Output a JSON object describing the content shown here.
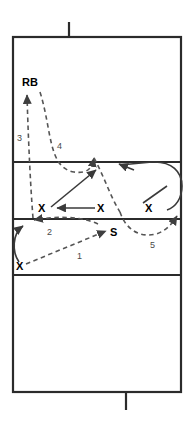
{
  "diagram": {
    "type": "football-play-diagram",
    "colors": {
      "field_line": "#2b2b2b",
      "solid_route": "#3a3a3a",
      "dashed_route": "#555555",
      "label": "#000000",
      "number": "#4a4a4a",
      "background": "#ffffff"
    },
    "field": {
      "outline": {
        "x": 13,
        "y": 37,
        "width": 168,
        "height": 355
      },
      "horizontal_lines_y": [
        162,
        219,
        275
      ],
      "ticks": [
        {
          "name": "top-hash-tick",
          "x": 69,
          "y1": 22,
          "y2": 37
        },
        {
          "name": "bottom-hash-tick",
          "x": 126,
          "y1": 392,
          "y2": 410
        }
      ]
    },
    "players": [
      {
        "id": "rb",
        "label": "RB",
        "x": 28,
        "y": 82,
        "kind": "text-label"
      },
      {
        "id": "x-left",
        "label": "X",
        "x": 42,
        "y": 211,
        "kind": "x-marker"
      },
      {
        "id": "x-mid",
        "label": "X",
        "x": 101,
        "y": 211,
        "kind": "x-marker"
      },
      {
        "id": "x-right",
        "label": "X",
        "x": 149,
        "y": 211,
        "kind": "x-marker"
      },
      {
        "id": "x-bottom-left",
        "label": "X",
        "x": 20,
        "y": 268,
        "kind": "x-marker"
      },
      {
        "id": "s-safety",
        "label": "S",
        "x": 114,
        "y": 234,
        "kind": "text-label"
      }
    ],
    "route_numbers": [
      {
        "id": "route-1",
        "label": "1",
        "x": 80,
        "y": 257
      },
      {
        "id": "route-2",
        "label": "2",
        "x": 49,
        "y": 232
      },
      {
        "id": "route-3",
        "label": "3",
        "x": 19,
        "y": 138
      },
      {
        "id": "route-4",
        "label": "4",
        "x": 59,
        "y": 146
      },
      {
        "id": "route-5",
        "label": "5",
        "x": 152,
        "y": 245
      }
    ],
    "routes": [
      {
        "id": "route-1-path",
        "style": "dashed",
        "desc": "from bottom-left X up-right to S"
      },
      {
        "id": "route-2-path",
        "style": "dashed",
        "desc": "from S back left to near left hash"
      },
      {
        "id": "route-3-path",
        "style": "dashed",
        "desc": "vertical up to RB"
      },
      {
        "id": "route-4-path",
        "style": "dashed",
        "desc": "curved up through middle to top"
      },
      {
        "id": "route-5-path",
        "style": "dashed",
        "desc": "curve right under mid X to right sideline"
      },
      {
        "id": "solid-diagonal",
        "style": "solid",
        "desc": "left X diagonally up-right"
      },
      {
        "id": "solid-horizontal",
        "style": "solid",
        "desc": "mid X left toward left X"
      },
      {
        "id": "solid-curve-right",
        "style": "solid",
        "desc": "right sideline loop back up-left"
      },
      {
        "id": "solid-curve-left",
        "style": "solid",
        "desc": "bottom-left X loop up to hash"
      }
    ]
  }
}
